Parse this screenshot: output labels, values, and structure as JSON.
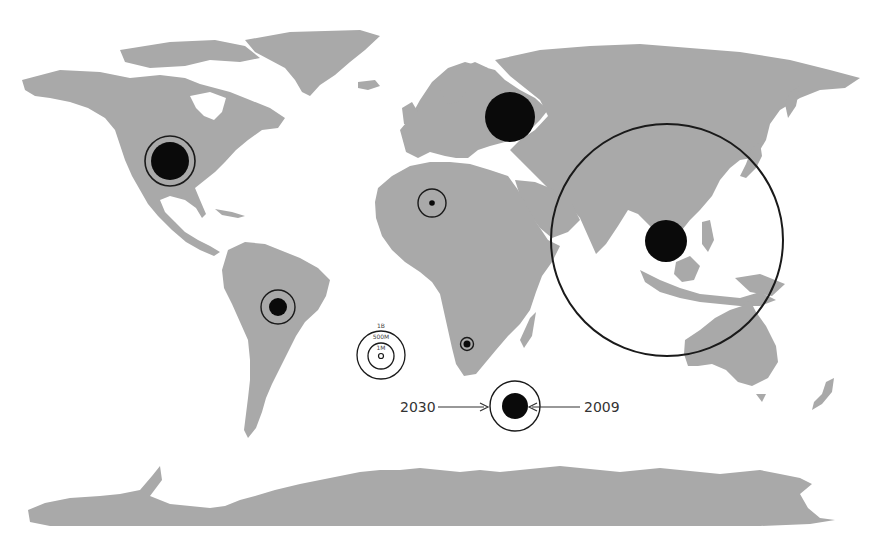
{
  "map": {
    "type": "world proportional-circle map",
    "land_color": "#a9a9a9",
    "circle_color": "#0a0a0a",
    "background": "#ffffff"
  },
  "legend_scale": {
    "labels": [
      "1B",
      "500M",
      "1M"
    ]
  },
  "legend_years": {
    "outer_label": "2030",
    "inner_label": "2009"
  },
  "regions": [
    {
      "name": "North America",
      "filled_2009": "large",
      "ring_2030": "slightly larger"
    },
    {
      "name": "Europe / Russia",
      "filled_2009": "large",
      "ring_2030": "same or smaller"
    },
    {
      "name": "North Africa / Middle East",
      "filled_2009": "tiny",
      "ring_2030": "small"
    },
    {
      "name": "South America",
      "filled_2009": "small",
      "ring_2030": "medium"
    },
    {
      "name": "Sub-Saharan Africa",
      "filled_2009": "tiny",
      "ring_2030": "tiny"
    },
    {
      "name": "Asia-Pacific",
      "filled_2009": "large",
      "ring_2030": "very large"
    }
  ]
}
